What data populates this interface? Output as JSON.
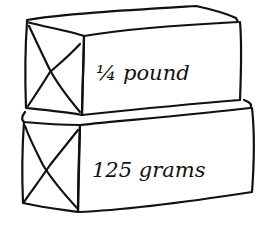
{
  "diagram": {
    "packages": [
      {
        "position": "top",
        "label": "1/4 pound",
        "label_display": "¼ pound"
      },
      {
        "position": "bottom",
        "label": "125 grams",
        "label_display": "125 grams"
      }
    ],
    "colors": {
      "ink": "#111111",
      "background": "#ffffff"
    }
  }
}
